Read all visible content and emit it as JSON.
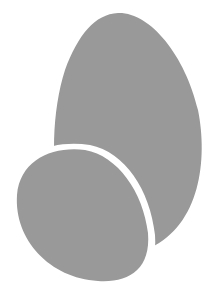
{
  "graphic": {
    "description": "Two overlapping gray egg shapes",
    "fill_color": "#999999",
    "background_color": "#ffffff",
    "shapes": [
      {
        "name": "large-egg"
      },
      {
        "name": "small-egg"
      }
    ]
  }
}
